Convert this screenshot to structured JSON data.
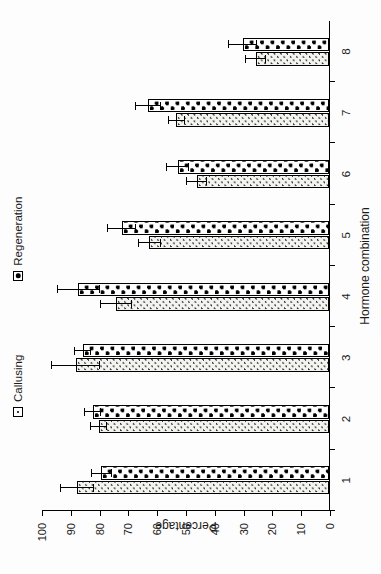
{
  "chart_data": {
    "type": "bar",
    "orientation": "rotated-90",
    "title": "",
    "xlabel": "Hormone combination",
    "ylabel": "Percentage",
    "ylim": [
      0,
      100
    ],
    "ytick_step": 10,
    "grid": false,
    "legend_position": "top",
    "categories": [
      "1",
      "2",
      "3",
      "4",
      "5",
      "6",
      "7",
      "8"
    ],
    "ytick_labels": [
      "0",
      "10",
      "20",
      "30",
      "40",
      "50",
      "60",
      "70",
      "80",
      "90",
      "100"
    ],
    "series": [
      {
        "name": "Callusing",
        "key_style": "light-dotted",
        "values": [
          87.5,
          80.0,
          88.0,
          74.0,
          62.5,
          46.0,
          53.0,
          25.5
        ],
        "errors": [
          6.0,
          3.0,
          8.5,
          5.5,
          4.0,
          3.5,
          3.0,
          3.5
        ]
      },
      {
        "name": "Regeneration",
        "key_style": "dark-checkered",
        "values": [
          79.0,
          82.0,
          85.5,
          87.0,
          72.0,
          52.5,
          63.0,
          30.0
        ],
        "errors": [
          3.5,
          3.0,
          3.0,
          7.5,
          5.0,
          4.0,
          4.5,
          5.0
        ]
      }
    ]
  },
  "legend": {
    "items": [
      {
        "label": "Callusing",
        "key": "light-square-icon"
      },
      {
        "label": "Regeneration",
        "key": "dark-square-icon"
      }
    ]
  },
  "axes": {
    "value_axis_label": "Percentage",
    "category_axis_label": "Hormone combination"
  }
}
